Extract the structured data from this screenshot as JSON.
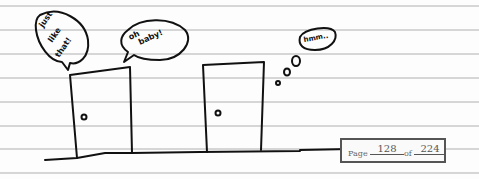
{
  "comic": {
    "bubbles": [
      {
        "type": "speech",
        "text": "just like that!"
      },
      {
        "type": "speech",
        "text": "oh baby!"
      },
      {
        "type": "thought",
        "text": "hmm..."
      }
    ],
    "doors": [
      {
        "label": "left door"
      },
      {
        "label": "right door"
      }
    ]
  },
  "pager": {
    "prefix": "Page",
    "current": "128",
    "separator": "of",
    "total": "224"
  },
  "colors": {
    "ink": "#111111",
    "rule_lines": "#d6d6d6",
    "paper": "#fdfdfd"
  }
}
